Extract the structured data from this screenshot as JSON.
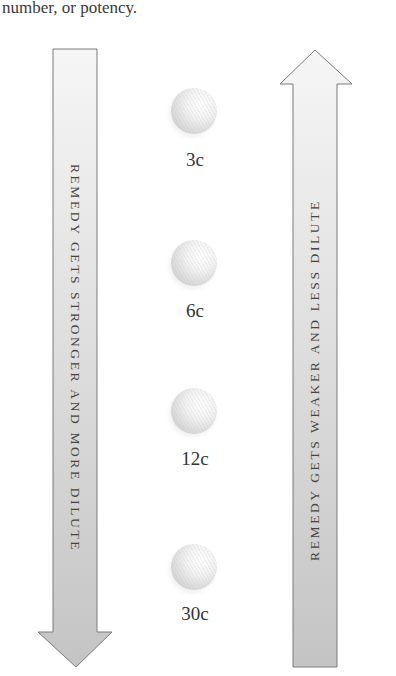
{
  "caption": "number, or potency.",
  "arrows": {
    "left": {
      "direction": "down",
      "label": "REMEDY GETS STRONGER AND MORE DILUTE",
      "fill": "#c8c8c8",
      "fill_top": "#f4f4f4"
    },
    "right": {
      "direction": "up",
      "label": "REMEDY GETS WEAKER AND LESS DILUTE",
      "fill": "#c8c8c8",
      "fill_top": "#f4f4f4"
    }
  },
  "potencies": [
    {
      "label": "3c"
    },
    {
      "label": "6c"
    },
    {
      "label": "12c"
    },
    {
      "label": "30c"
    }
  ],
  "colors": {
    "outline": "#7a7a7a",
    "text": "#333333"
  }
}
